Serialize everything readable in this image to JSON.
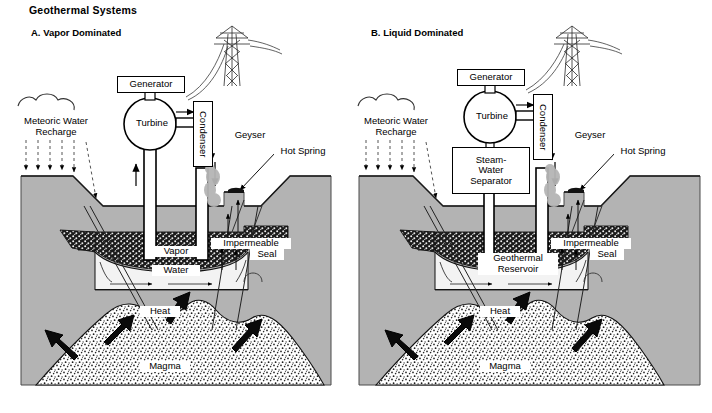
{
  "figure": {
    "title": "Geothermal Systems",
    "type": "cross-section-diagram",
    "background_color": "#ffffff",
    "colors": {
      "rock": "#b3b3b3",
      "reservoir": "#f2f2f2",
      "caprock": "#1a1a1a",
      "magma_stipple": "#ffffff",
      "ink": "#000000",
      "steam": "#b0b0b0"
    }
  },
  "panels": [
    {
      "id": "A",
      "label": "A.  Vapor Dominated",
      "annotations": {
        "recharge": "Meteoric Water\nRecharge",
        "recharge_line1": "Meteoric Water",
        "recharge_line2": "Recharge",
        "generator": "Generator",
        "turbine": "Turbine",
        "condenser": "Condenser",
        "geyser": "Geyser",
        "hot_spring": "Hot Spring",
        "impermeable_seal_line1": "Impermeable",
        "impermeable_seal_line2": "Seal",
        "zone_upper": "Vapor",
        "zone_lower": "Water",
        "heat": "Heat",
        "magma": "Magma"
      }
    },
    {
      "id": "B",
      "label": "B.  Liquid Dominated",
      "annotations": {
        "recharge": "Meteoric Water\nRecharge",
        "recharge_line1": "Meteoric Water",
        "recharge_line2": "Recharge",
        "generator": "Generator",
        "turbine": "Turbine",
        "condenser": "Condenser",
        "separator_line1": "Steam-",
        "separator_line2": "Water",
        "separator_line3": "Separator",
        "geyser": "Geyser",
        "hot_spring": "Hot Spring",
        "impermeable_seal_line1": "Impermeable",
        "impermeable_seal_line2": "Seal",
        "zone_line1": "Geothermal",
        "zone_line2": "Reservoir",
        "heat": "Heat",
        "magma": "Magma"
      }
    }
  ]
}
